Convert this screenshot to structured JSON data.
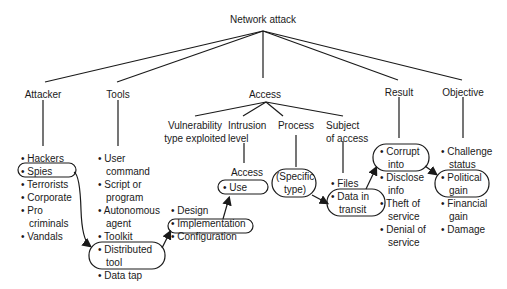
{
  "title": "Network attack",
  "categories": {
    "attacker": {
      "label": "Attacker",
      "items": [
        "• Hackers",
        "• Spies",
        "• Terrorists",
        "• Corporate",
        "• Pro",
        "criminals",
        "• Vandals"
      ]
    },
    "tools": {
      "label": "Tools",
      "items": [
        "• User",
        "command",
        "• Script or",
        "program",
        "• Autonomous",
        "agent",
        "• Toolkit",
        "• Distributed",
        "tool",
        "• Data tap"
      ]
    },
    "access": {
      "label": "Access",
      "subcategories": {
        "vulnerability": {
          "label_line1": "Vulnerability",
          "label_line2": "type exploited",
          "items": [
            "• Design",
            "• Implementation",
            "• Configuration"
          ]
        },
        "intrusion": {
          "label_line1": "Intrusion",
          "label_line2": "level",
          "sublabel": "Access",
          "items": [
            "• Use"
          ]
        },
        "process": {
          "label": "Process",
          "items": [
            "(Specific",
            "type)"
          ]
        },
        "subject": {
          "label_line1": "Subject",
          "label_line2": "of access",
          "items": [
            "• Files",
            "• Data in",
            "transit"
          ]
        }
      }
    },
    "result": {
      "label": "Result",
      "items": [
        "• Corrupt",
        "into",
        "• Disclose",
        "info",
        "• Theft of",
        "service",
        "• Denial of",
        "service"
      ]
    },
    "objective": {
      "label": "Objective",
      "items": [
        "• Challenge",
        "status",
        "• Political",
        "gain",
        "• Financial",
        "gain",
        "• Damage"
      ]
    }
  },
  "highlighted_path": [
    "Spies",
    "Distributed tool",
    "Implementation",
    "Use",
    "(Specific type)",
    "Data in transit",
    "Corrupt into",
    "Political gain"
  ],
  "colors": {
    "line": "#1a1a1a",
    "text": "#1a1a1a",
    "background": "#ffffff"
  }
}
